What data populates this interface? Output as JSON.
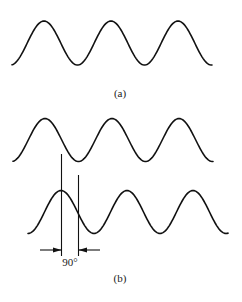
{
  "figure": {
    "panel_a": {
      "label": "(a)"
    },
    "panel_b": {
      "label": "(b)",
      "phase_label": "90°"
    }
  },
  "colors": {
    "stroke": "#111111",
    "background": "#ffffff"
  },
  "waves": [
    {
      "name": "wave-a",
      "x_start": 12,
      "x_end": 212,
      "y_mid": 43,
      "amplitude": 22,
      "period": 67,
      "first_peak_x": 44
    },
    {
      "name": "wave-b-reference",
      "x_start": 13,
      "x_end": 213,
      "y_mid": 140,
      "amplitude": 21.5,
      "period": 67,
      "first_peak_x": 45
    },
    {
      "name": "wave-b-shifted",
      "x_start": 28,
      "x_end": 228,
      "y_mid": 212,
      "amplitude": 21.5,
      "period": 66,
      "first_peak_x": 61
    }
  ]
}
